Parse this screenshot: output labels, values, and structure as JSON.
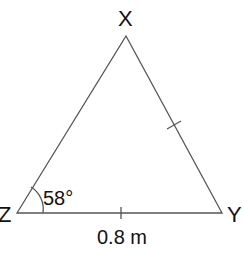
{
  "diagram": {
    "type": "triangle",
    "vertices": {
      "X": {
        "label": "X"
      },
      "Y": {
        "label": "Y"
      },
      "Z": {
        "label": "Z"
      }
    },
    "angle_label": "58°",
    "side_label": "0.8 m",
    "equal_side_marks": [
      "XY",
      "ZY"
    ],
    "colors": {
      "line": "#555555",
      "text": "#111111",
      "background": "#ffffff"
    }
  }
}
